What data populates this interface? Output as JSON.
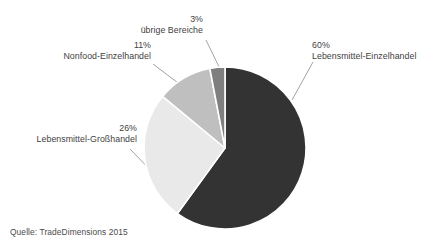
{
  "figure": {
    "ghost_cut_text": "",
    "source_note": "Quelle: TradeDimensions 2015"
  },
  "callouts": {
    "food_retail": {
      "pct": "60%",
      "name": "Lebensmittel-Einzelhandel"
    },
    "wholesale": {
      "pct": "26%",
      "name": "Lebensmittel-Großhandel"
    },
    "nonfood": {
      "pct": "11%",
      "name": "Nonfood-Einzelhandel"
    },
    "other": {
      "pct": "3%",
      "name": "übrige Bereiche"
    }
  },
  "chart_data": {
    "type": "pie",
    "title": "",
    "xlabel": "",
    "ylabel": "",
    "legend_position": "none",
    "grid": false,
    "start_angle_deg": 0,
    "direction": "clockwise",
    "separator_color": "#ffffff",
    "center": {
      "x": 225,
      "y": 148
    },
    "radius": 81,
    "labels": [
      "Lebensmittel-Einzelhandel",
      "Lebensmittel-Großhandel",
      "Nonfood-Einzelhandel",
      "übrige Bereiche"
    ],
    "values": [
      60,
      26,
      11,
      3
    ],
    "value_labels": [
      "60%",
      "26%",
      "11%",
      "3%"
    ],
    "colors": [
      "#333333",
      "#e9e9e9",
      "#bfbfbf",
      "#7f7f7f"
    ],
    "units": "percent",
    "total": 100,
    "source": "Quelle: TradeDimensions 2015"
  }
}
